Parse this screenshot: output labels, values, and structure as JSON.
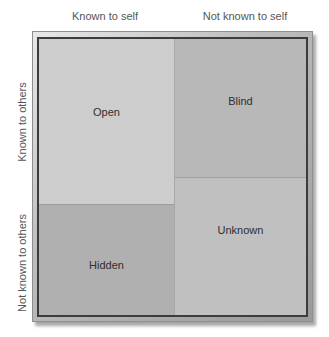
{
  "diagram": {
    "type": "johari-window",
    "column_headers": [
      "Known to self",
      "Not known to self"
    ],
    "row_headers": [
      "Known to others",
      "Not known to others"
    ],
    "quadrants": {
      "open": "Open",
      "blind": "Blind",
      "hidden": "Hidden",
      "unknown": "Unknown"
    },
    "colors": {
      "open": "#cdcdcd",
      "blind": "#b8b8b8",
      "hidden": "#b0b0b0",
      "unknown": "#c0c0c0",
      "frame_border": "#3c3c3c"
    }
  }
}
